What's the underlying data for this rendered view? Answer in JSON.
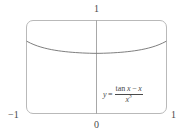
{
  "figure": {
    "name": "graph-of-tan-minus-x-over-x-cubed",
    "background_color": "#ffffff",
    "frame_color": "#b9b9b9",
    "axis_color": "#a8a8a8",
    "curve_color": "#6f6f6f",
    "text_color": "#4a4a4a"
  },
  "labels": {
    "top": "1",
    "bottom": "0",
    "left": "−1",
    "right": "1"
  },
  "equation": {
    "lhs": "y",
    "equals": "=",
    "numerator_func": "tan",
    "numerator_var": "x",
    "numerator_minus": "−",
    "numerator_second": "x",
    "denominator_base": "x",
    "denominator_exponent": "3",
    "plain": "y = (tan x − x) / x³"
  },
  "chart_data": {
    "type": "line",
    "title": "",
    "subtitle": "",
    "xlabel": "",
    "ylabel": "",
    "xlim": [
      -1,
      1
    ],
    "ylim": [
      -1,
      1
    ],
    "grid": false,
    "legend": null,
    "annotations": [
      {
        "text": "y = (tan x − x) / x³",
        "x": 0.25,
        "y": -0.38
      }
    ],
    "xticks": [
      -1,
      0,
      1
    ],
    "xticklabels": [
      "−1",
      "0",
      "1"
    ],
    "yticks": [
      1
    ],
    "yticklabels": [
      "1"
    ],
    "series": [
      {
        "name": "(tan x - x)/x^3",
        "x": [
          -1.0,
          -0.95,
          -0.9,
          -0.85,
          -0.8,
          -0.75,
          -0.7,
          -0.65,
          -0.6,
          -0.55,
          -0.5,
          -0.45,
          -0.4,
          -0.35,
          -0.3,
          -0.25,
          -0.2,
          -0.15,
          -0.1,
          -0.05,
          0.0,
          0.05,
          0.1,
          0.15,
          0.2,
          0.25,
          0.3,
          0.35,
          0.4,
          0.45,
          0.5,
          0.55,
          0.6,
          0.65,
          0.7,
          0.75,
          0.8,
          0.85,
          0.9,
          0.95,
          1.0
        ],
        "y": [
          0.5574,
          0.5187,
          0.4859,
          0.4578,
          0.4336,
          0.4127,
          0.3946,
          0.3788,
          0.3651,
          0.3532,
          0.3428,
          0.3339,
          0.3262,
          0.3195,
          0.3139,
          0.3091,
          0.3051,
          0.3018,
          0.2993,
          0.2975,
          0.2967,
          0.2975,
          0.2993,
          0.3018,
          0.3051,
          0.3091,
          0.3139,
          0.3195,
          0.3262,
          0.3339,
          0.3428,
          0.3532,
          0.3651,
          0.3788,
          0.3946,
          0.4127,
          0.4336,
          0.4578,
          0.4859,
          0.5187,
          0.5574
        ]
      }
    ]
  }
}
